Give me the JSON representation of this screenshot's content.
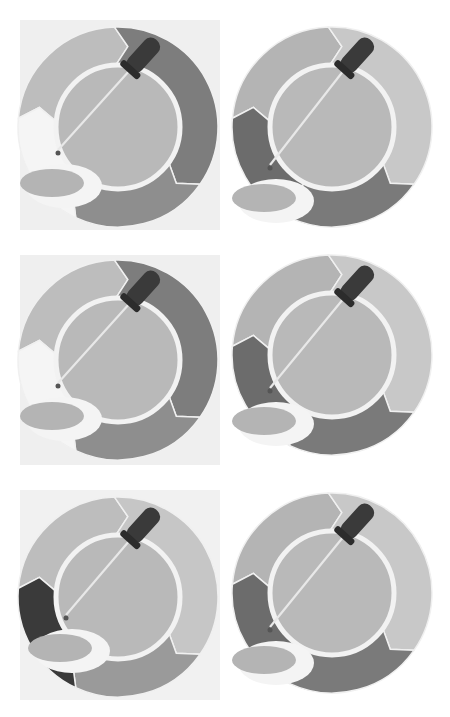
{
  "grid": {
    "columns": 2,
    "rows": 3,
    "ring_outer_radius": 100,
    "ring_inner_radius": 62,
    "inner_border_color": "#f2f2f2",
    "inner_fill": "#b9b9b9",
    "dropper_color": "#3a3a3a",
    "dish_rim_color": "#f4f4f4",
    "dish_fill": "#b4b4b4"
  },
  "icons": [
    {
      "name": "color-picker-icon-1",
      "has_background": true,
      "background": "#efefef",
      "box": {
        "x": 20,
        "y": 20,
        "w": 200,
        "h": 210
      },
      "center": {
        "x": 118,
        "y": 127
      },
      "segments": {
        "top_left": "#bdbdbd",
        "top_right": "#7d7d7d",
        "bottom_right": "#8e8e8e",
        "bottom_left": "#f5f5f5"
      },
      "dish": {
        "x": 52,
        "y": 180
      }
    },
    {
      "name": "color-picker-icon-2",
      "has_background": false,
      "background": "#ffffff",
      "box": {
        "x": 228,
        "y": 20,
        "w": 210,
        "h": 210
      },
      "center": {
        "x": 332,
        "y": 127
      },
      "segments": {
        "top_left": "#b4b4b4",
        "top_right": "#c8c8c8",
        "bottom_right": "#7a7a7a",
        "bottom_left": "#6c6c6c"
      },
      "dish": {
        "x": 264,
        "y": 195
      }
    },
    {
      "name": "color-picker-icon-3",
      "has_background": true,
      "background": "#efefef",
      "box": {
        "x": 20,
        "y": 255,
        "w": 200,
        "h": 210
      },
      "center": {
        "x": 118,
        "y": 360
      },
      "segments": {
        "top_left": "#bdbdbd",
        "top_right": "#7d7d7d",
        "bottom_right": "#8e8e8e",
        "bottom_left": "#f5f5f5"
      },
      "dish": {
        "x": 52,
        "y": 413
      }
    },
    {
      "name": "color-picker-icon-4",
      "has_background": false,
      "background": "#ffffff",
      "box": {
        "x": 228,
        "y": 250,
        "w": 210,
        "h": 215
      },
      "center": {
        "x": 332,
        "y": 355
      },
      "segments": {
        "top_left": "#b4b4b4",
        "top_right": "#c8c8c8",
        "bottom_right": "#7a7a7a",
        "bottom_left": "#6c6c6c"
      },
      "dish": {
        "x": 264,
        "y": 418
      }
    },
    {
      "name": "color-picker-icon-5",
      "has_background": true,
      "background": "#f1f1f1",
      "box": {
        "x": 20,
        "y": 490,
        "w": 200,
        "h": 210
      },
      "center": {
        "x": 118,
        "y": 597
      },
      "segments": {
        "top_left": "#bdbdbd",
        "top_right": "#c6c6c6",
        "bottom_right": "#9a9a9a",
        "bottom_left": "#3a3a3a"
      },
      "dish": {
        "x": 60,
        "y": 645
      }
    },
    {
      "name": "color-picker-icon-6",
      "has_background": false,
      "background": "#ffffff",
      "box": {
        "x": 228,
        "y": 488,
        "w": 210,
        "h": 215
      },
      "center": {
        "x": 332,
        "y": 593
      },
      "segments": {
        "top_left": "#b4b4b4",
        "top_right": "#c8c8c8",
        "bottom_right": "#7a7a7a",
        "bottom_left": "#6c6c6c"
      },
      "dish": {
        "x": 264,
        "y": 657
      }
    }
  ]
}
